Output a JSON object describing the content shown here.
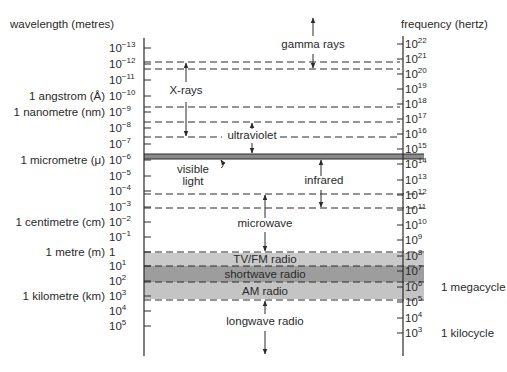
{
  "headers": {
    "left": "wavelength (metres)",
    "right": "frequency (hertz)"
  },
  "left_axis": {
    "ticks": [
      {
        "base": "10",
        "exp": "−13",
        "y": 48,
        "name": ""
      },
      {
        "base": "10",
        "exp": "−12",
        "y": 64,
        "name": ""
      },
      {
        "base": "10",
        "exp": "−11",
        "y": 80,
        "name": ""
      },
      {
        "base": "10",
        "exp": "−10",
        "y": 96,
        "name": "1 angstrom (Å)"
      },
      {
        "base": "10",
        "exp": "−9",
        "y": 112,
        "name": "1 nanometre (nm)"
      },
      {
        "base": "10",
        "exp": "−8",
        "y": 128,
        "name": ""
      },
      {
        "base": "10",
        "exp": "−7",
        "y": 144,
        "name": ""
      },
      {
        "base": "10",
        "exp": "−6",
        "y": 160,
        "name": "1 micrometre (μ)"
      },
      {
        "base": "10",
        "exp": "−5",
        "y": 176,
        "name": ""
      },
      {
        "base": "10",
        "exp": "−4",
        "y": 191,
        "name": ""
      },
      {
        "base": "10",
        "exp": "−3",
        "y": 207,
        "name": ""
      },
      {
        "base": "10",
        "exp": "−2",
        "y": 222,
        "name": "1 centimetre (cm)"
      },
      {
        "base": "10",
        "exp": "−1",
        "y": 237,
        "name": ""
      },
      {
        "base": "1",
        "exp": "",
        "y": 252,
        "name": "1 metre (m)"
      },
      {
        "base": "10",
        "exp": "1",
        "y": 266,
        "name": ""
      },
      {
        "base": "10",
        "exp": "2",
        "y": 281,
        "name": ""
      },
      {
        "base": "10",
        "exp": "3",
        "y": 296,
        "name": "1 kilometre (km)"
      },
      {
        "base": "10",
        "exp": "4",
        "y": 311,
        "name": ""
      },
      {
        "base": "10",
        "exp": "5",
        "y": 326,
        "name": ""
      }
    ]
  },
  "right_axis": {
    "ticks": [
      {
        "base": "10",
        "exp": "22",
        "y": 44,
        "name": ""
      },
      {
        "base": "10",
        "exp": "21",
        "y": 59,
        "name": ""
      },
      {
        "base": "10",
        "exp": "20",
        "y": 74,
        "name": ""
      },
      {
        "base": "10",
        "exp": "19",
        "y": 89,
        "name": ""
      },
      {
        "base": "10",
        "exp": "18",
        "y": 104,
        "name": ""
      },
      {
        "base": "10",
        "exp": "17",
        "y": 119,
        "name": ""
      },
      {
        "base": "10",
        "exp": "16",
        "y": 134,
        "name": ""
      },
      {
        "base": "10",
        "exp": "15",
        "y": 149,
        "name": ""
      },
      {
        "base": "10",
        "exp": "14",
        "y": 164,
        "name": ""
      },
      {
        "base": "10",
        "exp": "13",
        "y": 180,
        "name": ""
      },
      {
        "base": "10",
        "exp": "12",
        "y": 195,
        "name": ""
      },
      {
        "base": "10",
        "exp": "11",
        "y": 210,
        "name": ""
      },
      {
        "base": "10",
        "exp": "10",
        "y": 225,
        "name": ""
      },
      {
        "base": "10",
        "exp": "9",
        "y": 240,
        "name": ""
      },
      {
        "base": "10",
        "exp": "8",
        "y": 256,
        "name": ""
      },
      {
        "base": "10",
        "exp": "7",
        "y": 271,
        "name": ""
      },
      {
        "base": "10",
        "exp": "6",
        "y": 287,
        "name": "1 megacycle"
      },
      {
        "base": "10",
        "exp": "5",
        "y": 302,
        "name": ""
      },
      {
        "base": "10",
        "exp": "4",
        "y": 318,
        "name": ""
      },
      {
        "base": "10",
        "exp": "3",
        "y": 333,
        "name": "1 kilocycle"
      }
    ]
  },
  "bands": [
    {
      "label": "gamma rays",
      "x": 313,
      "y": 48
    },
    {
      "label": "X-rays",
      "x": 186,
      "y": 94
    },
    {
      "label": "ultraviolet",
      "x": 252,
      "y": 139
    },
    {
      "label": "visible",
      "x": 193,
      "y": 173
    },
    {
      "label": "light",
      "x": 193,
      "y": 185
    },
    {
      "label": "infrared",
      "x": 324,
      "y": 184
    },
    {
      "label": "microwave",
      "x": 265,
      "y": 227
    },
    {
      "label": "TV/FM radio",
      "x": 265,
      "y": 263
    },
    {
      "label": "shortwave radio",
      "x": 265,
      "y": 278
    },
    {
      "label": "AM radio",
      "x": 265,
      "y": 295
    },
    {
      "label": "longwave radio",
      "x": 265,
      "y": 325
    }
  ],
  "colors": {
    "line": "#2a2a2a",
    "tv_fm_band": "#c9c9c9",
    "shortwave_band": "#9d9d9d",
    "am_band": "#c4c4c4",
    "visible_band": "#808080"
  }
}
